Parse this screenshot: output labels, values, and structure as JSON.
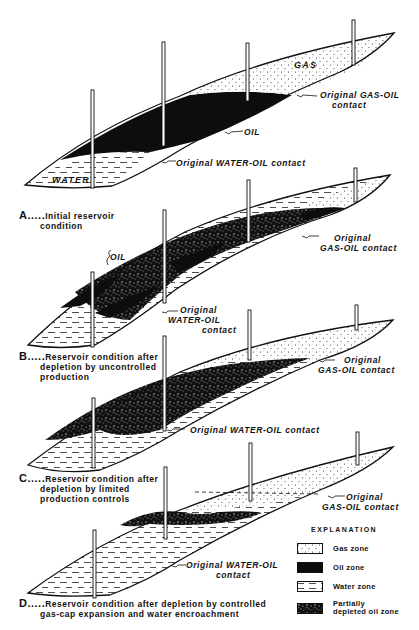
{
  "colors": {
    "ink": "#111111",
    "paper": "#ffffff",
    "gas_fill": "#ffffff",
    "oil_fill": "#0d0d0d",
    "water_fill": "#ffffff"
  },
  "panels": [
    {
      "id": "A",
      "letter": "A.....",
      "caption_lines": [
        "Initial reservoir",
        "condition"
      ],
      "zone_labels": {
        "gas": "GAS",
        "oil": "OIL",
        "water": "WATER"
      },
      "annotations": [
        {
          "name": "gas-oil-contact",
          "lines": [
            "Original GAS-OIL",
            "contact"
          ]
        },
        {
          "name": "oil-label",
          "lines": [
            "OIL"
          ]
        },
        {
          "name": "water-oil-contact",
          "lines": [
            "Original WATER-OIL contact"
          ]
        }
      ]
    },
    {
      "id": "B",
      "letter": "B.....",
      "caption_lines": [
        "Reservoir condition after",
        "depletion by uncontrolled",
        "production"
      ],
      "annotations": [
        {
          "name": "oil-label",
          "lines": [
            "OIL"
          ]
        },
        {
          "name": "gas-oil-contact",
          "lines": [
            "Original",
            "GAS-OIL contact"
          ]
        },
        {
          "name": "water-oil-contact",
          "lines": [
            "Original",
            "WATER-OIL",
            "contact"
          ]
        }
      ]
    },
    {
      "id": "C",
      "letter": "C.....",
      "caption_lines": [
        "Reservoir condition after",
        "depletion by limited",
        "production controls"
      ],
      "annotations": [
        {
          "name": "gas-oil-contact",
          "lines": [
            "Original",
            "GAS-OIL contact"
          ]
        },
        {
          "name": "water-oil-contact",
          "lines": [
            "Original WATER-OIL contact"
          ]
        }
      ]
    },
    {
      "id": "D",
      "letter": "D.....",
      "caption_lines": [
        "Reservoir condition after depletion by controlled",
        "gas-cap expansion  and water encroachment"
      ],
      "annotations": [
        {
          "name": "gas-oil-contact",
          "lines": [
            "Original",
            "GAS-OIL contact"
          ]
        },
        {
          "name": "water-oil-contact",
          "lines": [
            "Original WATER-OIL",
            "contact"
          ]
        }
      ]
    }
  ],
  "legend": {
    "title": "EXPLANATION",
    "items": [
      {
        "key": "gas",
        "label_lines": [
          "Gas zone"
        ]
      },
      {
        "key": "oil",
        "label_lines": [
          "Oil zone"
        ]
      },
      {
        "key": "water",
        "label_lines": [
          "Water zone"
        ]
      },
      {
        "key": "partial",
        "label_lines": [
          "Partially",
          "depleted oil zone"
        ]
      }
    ]
  }
}
